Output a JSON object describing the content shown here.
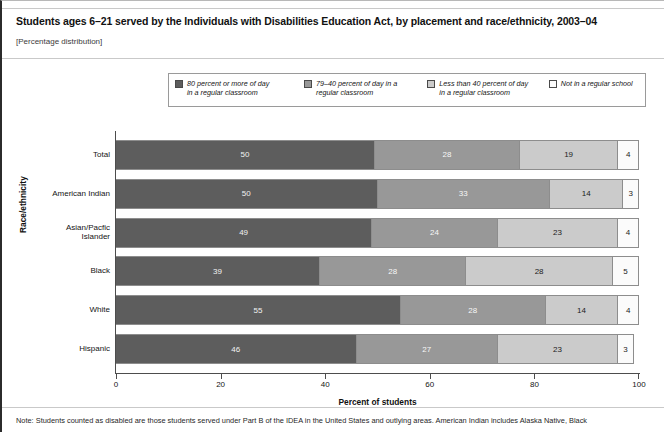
{
  "header": {
    "title": "Students ages 6–21 served by the Individuals with Disabilities Education Act, by placement and race/ethnicity, 2003–04",
    "subtitle": "[Percentage distribution]"
  },
  "note": {
    "text": "Note: Students counted as disabled are those students served under Part B of the IDEA in the United States and outlying areas. American Indian includes Alaska Native, Black"
  },
  "chart_data": {
    "type": "bar",
    "orientation": "horizontal",
    "stacked": true,
    "title": "Students ages 6–21 served by the Individuals with Disabilities Education Act, by placement and race/ethnicity, 2003–04",
    "subtitle": "[Percentage distribution]",
    "xlabel": "Percent of students",
    "ylabel": "Race/ethnicity",
    "xlim": [
      0,
      100
    ],
    "xticks": [
      0,
      20,
      40,
      60,
      80,
      100
    ],
    "xtick_labels": [
      "0",
      "20",
      "40",
      "60",
      "80",
      "100"
    ],
    "grid": false,
    "legend_position": "top",
    "categories": [
      "Total",
      "American Indian",
      "Asian/Pacfic Islander",
      "Black",
      "White",
      "Hispanic"
    ],
    "series": [
      {
        "name": "80 percent or more of day in a regular classroom",
        "legend_line1": "80 percent or more of day",
        "legend_line2": "in a regular classroom",
        "color": "#5d5d5d",
        "values": [
          50,
          50,
          49,
          39,
          55,
          46
        ]
      },
      {
        "name": "79–40 percent of day in a regular classroom",
        "legend_line1": "79–40 percent of day in a",
        "legend_line2": "regular classroom",
        "color": "#989898",
        "values": [
          28,
          33,
          24,
          28,
          28,
          27
        ]
      },
      {
        "name": "Less than 40 percent of day in a regular classroom",
        "legend_line1": "Less than 40 percent of day",
        "legend_line2": "in a regular classroom",
        "color": "#cbcbcb",
        "values": [
          19,
          14,
          23,
          28,
          14,
          23
        ]
      },
      {
        "name": "Not in a regular school",
        "legend_line1": "Not in a regular school",
        "legend_line2": "",
        "color": "#fbfbfb",
        "values": [
          4,
          3,
          4,
          5,
          4,
          3
        ]
      }
    ]
  }
}
